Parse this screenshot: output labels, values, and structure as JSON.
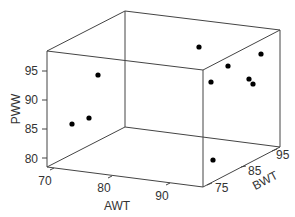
{
  "chart_data": {
    "type": "scatter3d",
    "title": "",
    "xlabel": "AWT",
    "ylabel": "BWT",
    "zlabel": "PWW",
    "x_ticks": [
      "70",
      "80",
      "90"
    ],
    "y_ticks": [
      "75",
      "85",
      "95"
    ],
    "z_ticks": [
      "80",
      "85",
      "90",
      "95"
    ],
    "grid": false,
    "legend": null,
    "marker_color": "#000000",
    "box_color": "#444444",
    "points_screen": [
      {
        "x": 199,
        "y": 47
      },
      {
        "x": 98,
        "y": 75
      },
      {
        "x": 228,
        "y": 66
      },
      {
        "x": 261,
        "y": 54
      },
      {
        "x": 211,
        "y": 82
      },
      {
        "x": 249,
        "y": 79
      },
      {
        "x": 253,
        "y": 84
      },
      {
        "x": 72,
        "y": 124
      },
      {
        "x": 89,
        "y": 118
      },
      {
        "x": 213,
        "y": 160
      }
    ]
  }
}
